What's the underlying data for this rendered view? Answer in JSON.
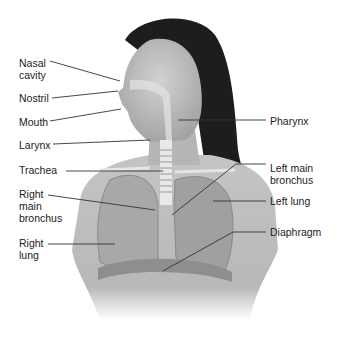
{
  "diagram": {
    "colors": {
      "line": "#333333",
      "skin": "#bdbdbd",
      "hair": "#1a1a1a",
      "lung": "#a9a9a9",
      "text": "#222222"
    },
    "labels": [
      {
        "id": "nasal-cavity",
        "text": "Nasal\ncavity",
        "x": 19,
        "y": 57,
        "side": "left",
        "line": [
          [
            50,
            61
          ],
          [
            120,
            81
          ]
        ]
      },
      {
        "id": "nostril",
        "text": "Nostril",
        "x": 19,
        "y": 92,
        "side": "left",
        "line": [
          [
            52,
            98
          ],
          [
            118,
            91
          ]
        ]
      },
      {
        "id": "mouth",
        "text": "Mouth",
        "x": 19,
        "y": 116,
        "side": "left",
        "line": [
          [
            50,
            121
          ],
          [
            121,
            109
          ]
        ]
      },
      {
        "id": "larynx",
        "text": "Larynx",
        "x": 19,
        "y": 139,
        "side": "left",
        "line": [
          [
            53,
            144
          ],
          [
            150,
            140
          ]
        ]
      },
      {
        "id": "trachea",
        "text": "Trachea",
        "x": 19,
        "y": 164,
        "side": "left",
        "line": [
          [
            66,
            171
          ],
          [
            163,
            171
          ]
        ]
      },
      {
        "id": "right-main-bronchus",
        "text": "Right\nmain\nbronchus",
        "x": 19,
        "y": 188,
        "side": "left",
        "line": [
          [
            48,
            195
          ],
          [
            155,
            210
          ]
        ]
      },
      {
        "id": "right-lung",
        "text": "Right\nlung",
        "x": 19,
        "y": 237,
        "side": "left",
        "line": [
          [
            48,
            244
          ],
          [
            115,
            244
          ]
        ]
      },
      {
        "id": "pharynx",
        "text": "Pharynx",
        "x": 270,
        "y": 115,
        "side": "right",
        "line": [
          [
            266,
            120
          ],
          [
            178,
            120
          ]
        ]
      },
      {
        "id": "left-main-bronchus",
        "text": "Left main\nbronchus",
        "x": 270,
        "y": 162,
        "side": "right",
        "line": [
          [
            266,
            164
          ],
          [
            236,
            164
          ],
          [
            172,
            215
          ]
        ]
      },
      {
        "id": "left-lung",
        "text": "Left lung",
        "x": 270,
        "y": 195,
        "side": "right",
        "line": [
          [
            266,
            201
          ],
          [
            213,
            201
          ]
        ]
      },
      {
        "id": "diaphragm",
        "text": "Diaphragm",
        "x": 270,
        "y": 226,
        "side": "right",
        "line": [
          [
            266,
            232
          ],
          [
            233,
            232
          ],
          [
            163,
            271
          ]
        ]
      }
    ]
  }
}
